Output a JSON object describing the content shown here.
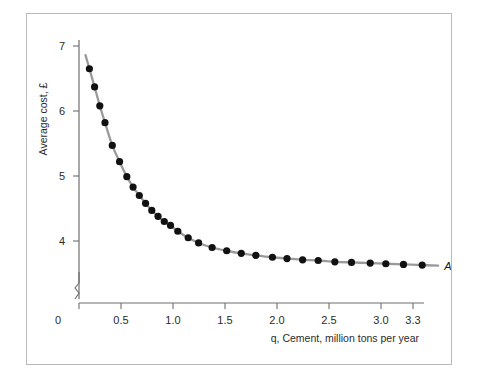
{
  "figure": {
    "background": "#ffffff",
    "frame_color": "#b9b9b9"
  },
  "chart_data": {
    "type": "scatter",
    "title": "",
    "xlabel": "q, Cement, million tons per year",
    "ylabel": "Average cost, £",
    "series_label": "AC",
    "xlim": [
      0,
      3.45
    ],
    "ylim": [
      3.35,
      7.25
    ],
    "grid": false,
    "legend_position": "curve-end-right",
    "xticks": [
      "0",
      "0.5",
      "1.0",
      "1.5",
      "2.0",
      "2.5",
      "3.0",
      "3.3"
    ],
    "xtick_values": [
      0,
      0.5,
      1.0,
      1.5,
      2.0,
      2.5,
      3.0,
      3.3
    ],
    "yticks": [
      "7",
      "6",
      "5",
      "4"
    ],
    "ytick_values": [
      7,
      6,
      5,
      4
    ],
    "y_axis_break": true,
    "marker_color": "#111111",
    "line_color": "#9a9a9a",
    "x": [
      0.1,
      0.15,
      0.2,
      0.25,
      0.32,
      0.39,
      0.46,
      0.52,
      0.58,
      0.64,
      0.7,
      0.76,
      0.82,
      0.88,
      0.95,
      1.05,
      1.15,
      1.28,
      1.42,
      1.56,
      1.7,
      1.86,
      2.0,
      2.15,
      2.3,
      2.46,
      2.62,
      2.8,
      2.95,
      3.12,
      3.3
    ],
    "y": [
      6.65,
      6.37,
      6.08,
      5.82,
      5.47,
      5.22,
      4.99,
      4.83,
      4.7,
      4.58,
      4.47,
      4.38,
      4.3,
      4.24,
      4.15,
      4.05,
      3.97,
      3.9,
      3.85,
      3.81,
      3.78,
      3.75,
      3.73,
      3.71,
      3.7,
      3.68,
      3.67,
      3.66,
      3.65,
      3.64,
      3.63
    ]
  }
}
